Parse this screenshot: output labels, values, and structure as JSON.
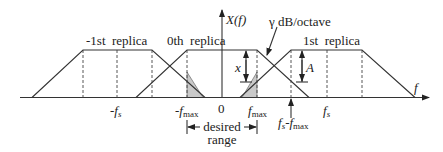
{
  "diagram": {
    "vertical_axis_label": "X(f)",
    "horizontal_axis_label": "f",
    "replicas": [
      {
        "label": "-1st  replica"
      },
      {
        "label": "0th  replica"
      },
      {
        "label": "1st  replica"
      }
    ],
    "slope_label": "γ dB/octave",
    "x_label": "x",
    "a_label": "A",
    "tick_labels": {
      "neg_fs": "-f",
      "neg_fs_sub": "s",
      "neg_fmax": "-f",
      "neg_fmax_sub": "max",
      "zero": "0",
      "fmax": "f",
      "fmax_sub": "max",
      "fs_minus_fmax_a": "f",
      "fs_minus_fmax_a_sub": "s",
      "fs_minus_fmax_b": "-f",
      "fs_minus_fmax_b_sub": "max",
      "fs": "f",
      "fs_sub": "s"
    },
    "desired_range_line1": "desired",
    "desired_range_line2": "range"
  }
}
